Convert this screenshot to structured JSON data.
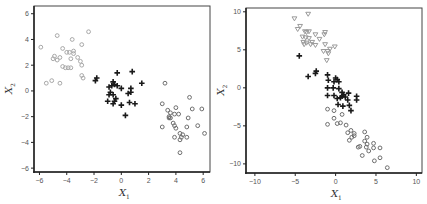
{
  "chart_data": [
    {
      "type": "scatter",
      "title": "",
      "xlabel": "X1",
      "ylabel": "X2",
      "xlim": [
        -6.4,
        6.5
      ],
      "ylim": [
        -6.3,
        6.6
      ],
      "xticks": [
        -6,
        -4,
        -2,
        0,
        2,
        4,
        6
      ],
      "yticks": [
        -6,
        -4,
        -2,
        0,
        2,
        4,
        6
      ],
      "grid": false,
      "legend": null,
      "series": [
        {
          "name": "cluster-1",
          "marker": "circle",
          "color": "#a8a8a8",
          "points": [
            [
              -5.9,
              3.4
            ],
            [
              -4.7,
              4.3
            ],
            [
              -3.6,
              4.0
            ],
            [
              -2.4,
              4.6
            ],
            [
              -2.9,
              3.6
            ],
            [
              -4.3,
              3.3
            ],
            [
              -4.0,
              3.0
            ],
            [
              -3.8,
              3.0
            ],
            [
              -3.5,
              3.1
            ],
            [
              -3.5,
              2.9
            ],
            [
              -4.9,
              2.7
            ],
            [
              -5.0,
              2.5
            ],
            [
              -4.7,
              2.4
            ],
            [
              -4.5,
              2.6
            ],
            [
              -3.2,
              2.6
            ],
            [
              -3.7,
              2.5
            ],
            [
              -3.0,
              2.3
            ],
            [
              -2.9,
              2.0
            ],
            [
              -4.3,
              1.9
            ],
            [
              -4.1,
              1.8
            ],
            [
              -3.9,
              1.8
            ],
            [
              -3.7,
              1.8
            ],
            [
              -2.9,
              1.2
            ],
            [
              -2.8,
              1.0
            ],
            [
              -5.5,
              0.6
            ],
            [
              -5.1,
              0.8
            ],
            [
              -4.5,
              0.6
            ]
          ]
        },
        {
          "name": "cluster-2",
          "marker": "plus",
          "color": "#1a1a1a",
          "points": [
            [
              -1.9,
              0.8
            ],
            [
              -1.8,
              1.0
            ],
            [
              -0.3,
              1.4
            ],
            [
              0.8,
              1.5
            ],
            [
              1.5,
              0.6
            ],
            [
              -0.6,
              0.7
            ],
            [
              -0.7,
              0.4
            ],
            [
              -0.5,
              0.5
            ],
            [
              -0.3,
              0.4
            ],
            [
              -0.9,
              0.3
            ],
            [
              0.7,
              0.2
            ],
            [
              0.0,
              0.2
            ],
            [
              -0.8,
              -0.1
            ],
            [
              -0.6,
              -0.3
            ],
            [
              -0.9,
              -0.3
            ],
            [
              0.7,
              -0.1
            ],
            [
              0.5,
              -0.2
            ],
            [
              -0.4,
              -0.6
            ],
            [
              -0.5,
              -0.8
            ],
            [
              -1.0,
              -0.8
            ],
            [
              -0.6,
              -1.0
            ],
            [
              0.0,
              -1.1
            ],
            [
              0.6,
              -0.9
            ],
            [
              1.0,
              -1.0
            ],
            [
              0.3,
              -1.9
            ]
          ]
        },
        {
          "name": "cluster-3",
          "marker": "circle",
          "color": "#6e6e6e",
          "points": [
            [
              3.2,
              0.6
            ],
            [
              3.0,
              -1.0
            ],
            [
              4.0,
              -1.3
            ],
            [
              5.0,
              -0.5
            ],
            [
              5.2,
              -1.4
            ],
            [
              5.9,
              -1.4
            ],
            [
              3.4,
              -1.5
            ],
            [
              3.6,
              -1.7
            ],
            [
              3.9,
              -1.8
            ],
            [
              4.2,
              -1.8
            ],
            [
              3.5,
              -2.0
            ],
            [
              3.5,
              -2.1
            ],
            [
              3.6,
              -2.1
            ],
            [
              4.9,
              -2.1
            ],
            [
              3.8,
              -2.5
            ],
            [
              3.9,
              -2.7
            ],
            [
              4.0,
              -2.9
            ],
            [
              3.0,
              -2.8
            ],
            [
              4.8,
              -2.8
            ],
            [
              5.6,
              -2.7
            ],
            [
              4.3,
              -3.3
            ],
            [
              4.5,
              -3.4
            ],
            [
              4.4,
              -3.6
            ],
            [
              4.3,
              -3.8
            ],
            [
              3.9,
              -3.6
            ],
            [
              4.8,
              -3.6
            ],
            [
              6.1,
              -3.3
            ],
            [
              4.3,
              -4.8
            ]
          ]
        }
      ]
    },
    {
      "type": "scatter",
      "title": "",
      "xlabel": "X1",
      "ylabel": "X2",
      "xlim": [
        -11.1,
        10.7
      ],
      "ylim": [
        -11.2,
        10.5
      ],
      "xticks": [
        -10,
        -5,
        0,
        5,
        10
      ],
      "yticks": [
        -10,
        -5,
        0,
        5,
        10
      ],
      "grid": false,
      "legend": null,
      "series": [
        {
          "name": "cluster-1",
          "marker": "triangle-down",
          "color": "#9a9a9a",
          "points": [
            [
              -5.1,
              9.1
            ],
            [
              -3.4,
              9.7
            ],
            [
              -4.7,
              7.7
            ],
            [
              -4.4,
              8.1
            ],
            [
              -3.8,
              7.4
            ],
            [
              -3.6,
              7.3
            ],
            [
              -3.3,
              7.4
            ],
            [
              -2.5,
              7.0
            ],
            [
              -1.3,
              7.3
            ],
            [
              -1.4,
              7.0
            ],
            [
              -4.1,
              6.7
            ],
            [
              -3.7,
              6.6
            ],
            [
              -3.3,
              6.5
            ],
            [
              -4.0,
              6.0
            ],
            [
              -3.6,
              5.9
            ],
            [
              -3.9,
              5.7
            ],
            [
              -2.9,
              6.0
            ],
            [
              -2.5,
              5.6
            ],
            [
              -3.1,
              5.7
            ],
            [
              -1.3,
              5.7
            ],
            [
              -0.1,
              5.4
            ],
            [
              -0.7,
              5.1
            ],
            [
              -1.0,
              4.8
            ],
            [
              -0.9,
              4.5
            ],
            [
              -1.5,
              4.8
            ],
            [
              -1.1,
              3.6
            ],
            [
              -2.0,
              6.4
            ]
          ]
        },
        {
          "name": "cluster-2",
          "marker": "plus",
          "color": "#1a1a1a",
          "points": [
            [
              -4.5,
              4.2
            ],
            [
              -3.4,
              1.5
            ],
            [
              -2.5,
              1.9
            ],
            [
              -2.4,
              2.2
            ],
            [
              -1.0,
              1.7
            ],
            [
              -0.9,
              1.0
            ],
            [
              0.0,
              1.3
            ],
            [
              0.2,
              1.1
            ],
            [
              0.4,
              0.8
            ],
            [
              -0.2,
              0.8
            ],
            [
              -1.0,
              0.0
            ],
            [
              -0.3,
              0.0
            ],
            [
              0.4,
              -0.1
            ],
            [
              0.8,
              -0.6
            ],
            [
              1.0,
              -0.9
            ],
            [
              1.6,
              -0.7
            ],
            [
              -1.0,
              -1.0
            ],
            [
              -0.2,
              -1.0
            ],
            [
              0.2,
              -1.4
            ],
            [
              0.8,
              -1.1
            ],
            [
              1.2,
              -1.2
            ],
            [
              1.5,
              -1.6
            ],
            [
              2.6,
              -1.1
            ],
            [
              2.6,
              -1.6
            ],
            [
              0.3,
              -2.2
            ],
            [
              0.9,
              -2.4
            ],
            [
              1.7,
              -2.3
            ],
            [
              1.9,
              -3.0
            ],
            [
              0.6,
              -1.3
            ]
          ]
        },
        {
          "name": "cluster-3",
          "marker": "circle",
          "color": "#6e6e6e",
          "points": [
            [
              -1.0,
              -2.8
            ],
            [
              -0.2,
              -3.0
            ],
            [
              0.8,
              -3.5
            ],
            [
              -0.2,
              -4.0
            ],
            [
              -1.0,
              -4.8
            ],
            [
              0.2,
              -4.7
            ],
            [
              0.6,
              -4.6
            ],
            [
              1.3,
              -4.9
            ],
            [
              1.9,
              -5.6
            ],
            [
              1.5,
              -5.9
            ],
            [
              2.3,
              -6.0
            ],
            [
              2.0,
              -6.5
            ],
            [
              1.7,
              -6.9
            ],
            [
              2.3,
              -6.3
            ],
            [
              3.6,
              -5.8
            ],
            [
              3.9,
              -6.5
            ],
            [
              3.6,
              -7.0
            ],
            [
              4.7,
              -7.3
            ],
            [
              2.8,
              -7.8
            ],
            [
              3.0,
              -7.7
            ],
            [
              3.8,
              -7.8
            ],
            [
              4.1,
              -8.3
            ],
            [
              4.7,
              -7.9
            ],
            [
              5.5,
              -7.9
            ],
            [
              3.3,
              -8.9
            ],
            [
              4.8,
              -9.6
            ],
            [
              5.5,
              -9.2
            ],
            [
              6.4,
              -10.5
            ],
            [
              3.9,
              -7.4
            ]
          ]
        }
      ]
    }
  ]
}
